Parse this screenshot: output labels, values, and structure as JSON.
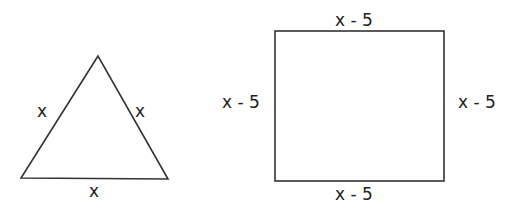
{
  "figure": {
    "triangle": {
      "left_side_label": "x",
      "right_side_label": "x",
      "base_label": "x"
    },
    "square": {
      "top_label": "x - 5",
      "left_label": "x - 5",
      "right_label": "x - 5",
      "bottom_label": "x - 5"
    },
    "stroke_color": "#333333"
  }
}
